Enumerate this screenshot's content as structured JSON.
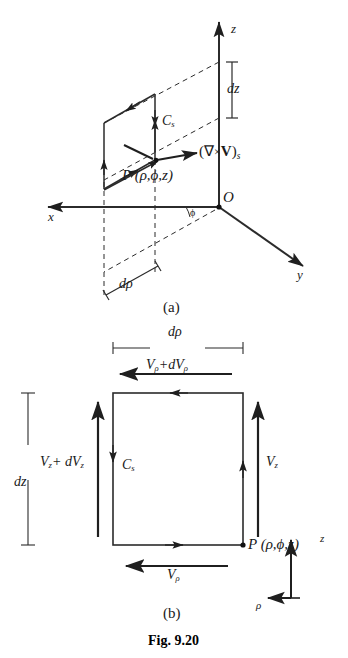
{
  "figure": {
    "caption": "Fig. 9.20",
    "panels": [
      {
        "id": "a",
        "label": "(a)"
      },
      {
        "id": "b",
        "label": "(b)"
      }
    ]
  },
  "panel_a": {
    "axes": [
      {
        "name": "z-axis-label",
        "label": "z"
      },
      {
        "name": "x-axis-label",
        "label": "x"
      },
      {
        "name": "y-axis-label",
        "label": "y"
      }
    ],
    "origin_label": "O",
    "angle_label": "ϕ",
    "dim_dz": "dz",
    "dim_drho": "dρ",
    "contour_label_base": "C",
    "contour_label_sub": "s",
    "point_label": "P (ρ,ϕ,z)",
    "curl_label_open": "(",
    "curl_label_nabla": "∇",
    "curl_label_times": "×",
    "curl_label_v": "V",
    "curl_label_close": ")",
    "curl_label_sub": "s"
  },
  "panel_b": {
    "dim_drho": "dρ",
    "dim_dz": "dz",
    "top_edge_label_base": "V",
    "top_edge_label_sub1": "ρ",
    "top_edge_label_mid": "+d",
    "top_edge_label_base2": "V",
    "top_edge_label_sub2": "ρ",
    "left_edge_label_base": "V",
    "left_edge_label_sub1": "z",
    "left_edge_label_mid": "+ d",
    "left_edge_label_base2": "V",
    "left_edge_label_sub2": "z",
    "right_edge_label_base": "V",
    "right_edge_label_sub": "z",
    "bottom_edge_label_base": "V",
    "bottom_edge_label_sub": "ρ",
    "contour_label_base": "C",
    "contour_label_sub": "s",
    "point_label": "P (ρ,ϕ,z)",
    "mini_axis_z": "z",
    "mini_axis_rho": "ρ"
  },
  "colors": {
    "ink": "#1a1a1a",
    "line": "#2b2b2b",
    "background": "#ffffff"
  }
}
